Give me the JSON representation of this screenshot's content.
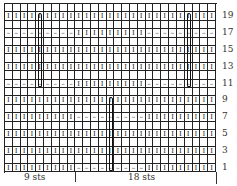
{
  "chart_title": "Cable knitting chart",
  "grid": {
    "columns": 27,
    "rows": 20
  },
  "symbols": {
    "knit": "I",
    "purl": "–",
    "blank": ""
  },
  "row_patterns": {
    "1": {
      "knit": [
        [
          1,
          9
        ],
        [
          19,
          27
        ]
      ],
      "purl": [
        [
          10,
          18
        ]
      ]
    },
    "3": {
      "knit": [
        [
          1,
          27
        ]
      ]
    },
    "5": {
      "knit": [
        [
          1,
          27
        ]
      ]
    },
    "7": {
      "knit": [
        [
          1,
          9
        ],
        [
          19,
          27
        ]
      ],
      "purl": [
        [
          10,
          18
        ]
      ]
    },
    "9": {
      "knit": [
        [
          1,
          27
        ]
      ]
    },
    "11": {
      "purl": [
        [
          1,
          9
        ],
        [
          19,
          27
        ]
      ],
      "knit": [
        [
          10,
          18
        ]
      ]
    },
    "13": {
      "knit": [
        [
          1,
          27
        ]
      ]
    },
    "15": {
      "knit": [
        [
          1,
          27
        ]
      ]
    },
    "17": {
      "purl": [
        [
          1,
          9
        ],
        [
          19,
          27
        ]
      ],
      "knit": [
        [
          10,
          18
        ]
      ]
    },
    "19": {
      "knit": [
        [
          1,
          27
        ]
      ]
    }
  },
  "cables": [
    {
      "column": 5,
      "from_row": 11,
      "to_row": 19
    },
    {
      "column": 24,
      "from_row": 11,
      "to_row": 19
    },
    {
      "column": 14,
      "from_row": 1,
      "to_row": 9
    }
  ],
  "row_labels": [
    "19",
    "17",
    "15",
    "13",
    "11",
    "9",
    "7",
    "5",
    "3",
    "1"
  ],
  "bottom_labels": {
    "left": "9 sts",
    "right": "18 sts"
  }
}
